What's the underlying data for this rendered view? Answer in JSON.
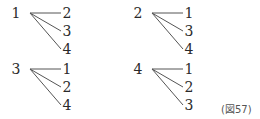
{
  "diagram": {
    "type": "tree-diagram",
    "trees": [
      {
        "root": "1",
        "leaves": [
          "2",
          "3",
          "4"
        ]
      },
      {
        "root": "2",
        "leaves": [
          "1",
          "3",
          "4"
        ]
      },
      {
        "root": "3",
        "leaves": [
          "1",
          "2",
          "4"
        ]
      },
      {
        "root": "4",
        "leaves": [
          "1",
          "2",
          "3"
        ]
      }
    ],
    "caption": "(図57)",
    "line_color": "#555555"
  }
}
